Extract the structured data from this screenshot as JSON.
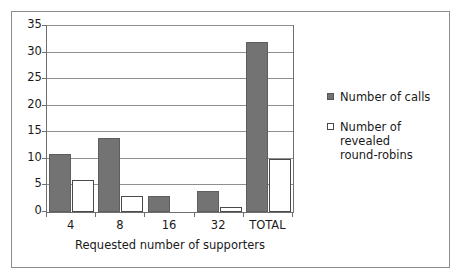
{
  "chart_data": {
    "type": "bar",
    "title": "",
    "xlabel": "Requested number of supporters",
    "ylabel": "",
    "categories": [
      "4",
      "8",
      "16",
      "32",
      "TOTAL"
    ],
    "series": [
      {
        "name": "Number of calls",
        "values": [
          11,
          14,
          3,
          4,
          32
        ],
        "color": "#737373",
        "style": "filled"
      },
      {
        "name": "Number of revealed round-robins",
        "values": [
          6,
          3,
          0,
          1,
          10
        ],
        "color": "#ffffff",
        "style": "hollow"
      }
    ],
    "ylim": [
      0,
      35
    ],
    "ytick_values": [
      0,
      5,
      10,
      15,
      20,
      25,
      30,
      35
    ],
    "ytick_labels": [
      "0",
      "5",
      "10",
      "15",
      "20",
      "25",
      "30",
      "35"
    ],
    "grid": true,
    "grid_axis": "y",
    "legend_position": "right"
  },
  "legend": {
    "entries": [
      {
        "label": "Number of calls"
      },
      {
        "label": "Number of revealed\nround-robins"
      }
    ]
  },
  "axis": {
    "x_title": "Requested number of supporters"
  }
}
